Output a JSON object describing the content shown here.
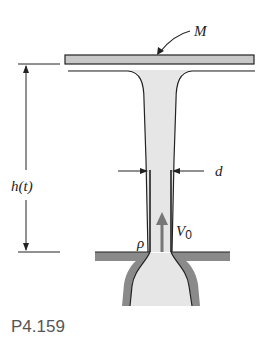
{
  "figure": {
    "caption": "P4.159",
    "labels": {
      "mass": "M",
      "height": "h(t)",
      "diameter": "d",
      "density": "ρ",
      "velocity_main": "V",
      "velocity_sub": "0"
    },
    "colors": {
      "fluid": "#e6e6e6",
      "plate": "#c8c8c8",
      "wall": "#8a8a8a",
      "line": "#222222",
      "arrow": "#777777",
      "caption": "#555555"
    }
  }
}
